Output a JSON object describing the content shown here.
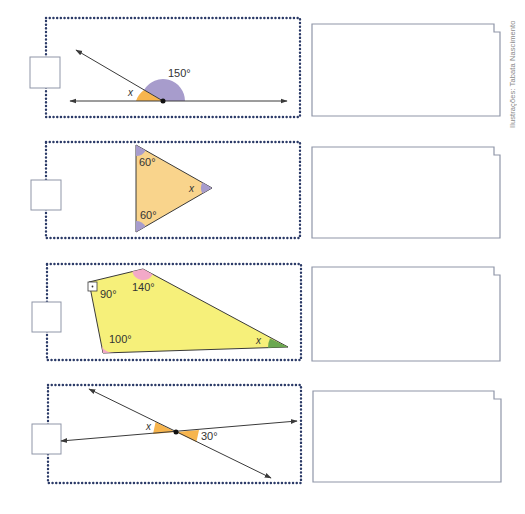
{
  "credit": "Ilustrações: Tabata Nascimento",
  "colors": {
    "dotted_border": "#2b3a67",
    "answer_box_border": "#8f96a8",
    "line": "#3a3a3a",
    "orange_angle": "#f7b54e",
    "purple_angle": "#a79ccc",
    "triangle_fill": "#f9d48c",
    "quad_fill": "#f6f07a",
    "pink_angle": "#f3a9c8",
    "green_angle": "#6aa84f",
    "label": "#333333"
  },
  "exercises": [
    {
      "id": "a",
      "figure": "supplementary-angles",
      "labels": {
        "given": "150°",
        "unknown": "x"
      },
      "answer_box": "",
      "response_box": ""
    },
    {
      "id": "b",
      "figure": "triangle",
      "labels": {
        "angle_top": "60°",
        "angle_bottom": "60°",
        "unknown": "x"
      },
      "answer_box": "",
      "response_box": ""
    },
    {
      "id": "c",
      "figure": "quadrilateral",
      "labels": {
        "angle_right": "90°",
        "angle_top": "140°",
        "angle_bottom": "100°",
        "unknown": "x"
      },
      "answer_box": "",
      "response_box": ""
    },
    {
      "id": "d",
      "figure": "vertical-angles",
      "labels": {
        "given": "30°",
        "unknown": "x"
      },
      "answer_box": "",
      "response_box": ""
    }
  ]
}
